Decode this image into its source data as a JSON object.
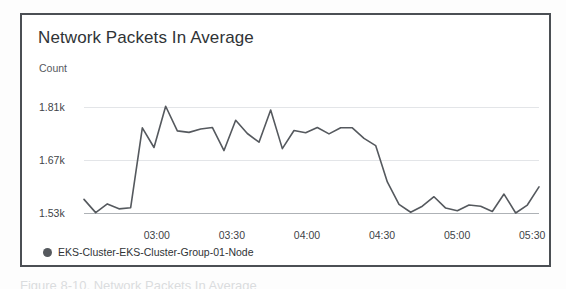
{
  "widget": {
    "title": "Network Packets In Average",
    "legend": {
      "marker_color": "#55595e",
      "label": "EKS-Cluster-EKS-Cluster-Group-01-Node"
    }
  },
  "caption": "Figure 8-10.  Network Packets In Average",
  "chart_data": {
    "type": "line",
    "title": "Network Packets In Average",
    "xlabel": "",
    "ylabel": "Count",
    "ylim": [
      1530,
      1810
    ],
    "ytick_labels": [
      "1.81k",
      "1.67k",
      "1.53k"
    ],
    "ytick_values": [
      1810,
      1670,
      1530
    ],
    "xtick_labels": [
      "03:00",
      "03:30",
      "04:00",
      "04:30",
      "05:00",
      "05:30"
    ],
    "grid": true,
    "legend_position": "bottom-left",
    "line_color": "#55595e",
    "series": [
      {
        "name": "EKS-Cluster-EKS-Cluster-Group-01-Node",
        "values": [
          1566,
          1531,
          1554,
          1541,
          1544,
          1755,
          1703,
          1812,
          1747,
          1743,
          1752,
          1756,
          1695,
          1775,
          1740,
          1717,
          1802,
          1700,
          1748,
          1742,
          1756,
          1739,
          1755,
          1755,
          1727,
          1708,
          1612,
          1553,
          1532,
          1548,
          1573,
          1543,
          1536,
          1551,
          1548,
          1534,
          1580,
          1530,
          1551,
          1599
        ]
      }
    ]
  }
}
